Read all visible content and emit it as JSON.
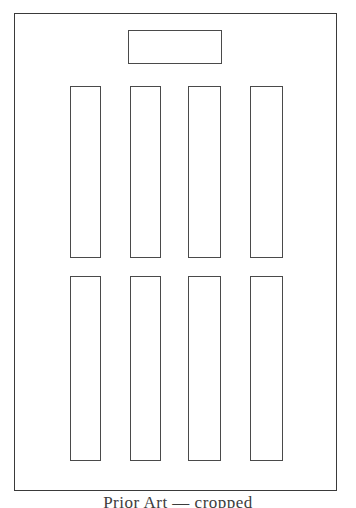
{
  "figure": {
    "title": "",
    "background_color": "#ffffff",
    "line_color": "#4a4a4a",
    "frame_color": "#3a3a3a",
    "frame": {
      "name": "outer-frame",
      "label": "",
      "x": 14,
      "y": 13,
      "width": 323,
      "height": 478
    },
    "header_rect": {
      "name": "header-rectangle",
      "label": "",
      "x": 128,
      "y": 30,
      "width": 94,
      "height": 34
    },
    "slots": [
      {
        "label": "",
        "x": 70,
        "y": 86,
        "width": 31,
        "height": 172,
        "row": "upper",
        "column": 1
      },
      {
        "label": "",
        "x": 130,
        "y": 86,
        "width": 31,
        "height": 172,
        "row": "upper",
        "column": 2
      },
      {
        "label": "",
        "x": 188,
        "y": 86,
        "width": 33,
        "height": 172,
        "row": "upper",
        "column": 3
      },
      {
        "label": "",
        "x": 250,
        "y": 86,
        "width": 33,
        "height": 172,
        "row": "upper",
        "column": 4
      },
      {
        "label": "",
        "x": 70,
        "y": 276,
        "width": 31,
        "height": 185,
        "row": "lower",
        "column": 1
      },
      {
        "label": "",
        "x": 130,
        "y": 276,
        "width": 31,
        "height": 185,
        "row": "lower",
        "column": 2
      },
      {
        "label": "",
        "x": 188,
        "y": 276,
        "width": 33,
        "height": 185,
        "row": "lower",
        "column": 3
      },
      {
        "label": "",
        "x": 250,
        "y": 276,
        "width": 33,
        "height": 185,
        "row": "lower",
        "column": 4
      }
    ],
    "caption": {
      "text": "Prior Art  —  cropped",
      "note": "cropped at image bottom edge; only ascender tips visible"
    }
  }
}
